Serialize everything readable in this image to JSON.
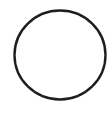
{
  "canvas": {
    "width": 108,
    "height": 116,
    "background": "#ffffff"
  },
  "shape": {
    "type": "circle-outline",
    "cx": 60,
    "cy": 55,
    "rx": 45.5,
    "ry": 44.5,
    "stroke": "#1e1e1e",
    "stroke_width": 2.4,
    "fill": "#ffffff"
  }
}
